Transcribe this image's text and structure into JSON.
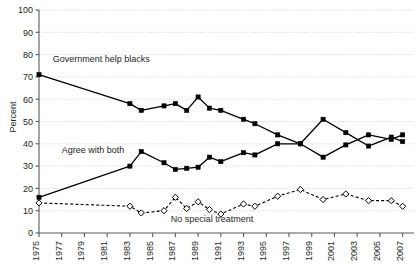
{
  "chart_data": {
    "type": "line",
    "title": "",
    "subtitle": "",
    "xlabel": "",
    "ylabel": "Percent",
    "ylim": [
      0,
      100
    ],
    "xlim": [
      1975,
      2008
    ],
    "ytick_step": 10,
    "yticks": [
      "0",
      "10",
      "20",
      "30",
      "40",
      "50",
      "60",
      "70",
      "80",
      "90",
      "100"
    ],
    "xticks": [
      "1975",
      "1977",
      "1979",
      "1981",
      "1983",
      "1985",
      "1987",
      "1989",
      "1991",
      "1993",
      "1995",
      "1997",
      "1999",
      "2001",
      "2003",
      "2005",
      "2007"
    ],
    "grid": "horizontal-dotted",
    "legend_position": "inline-annotations",
    "annotations": [
      {
        "text": "Government help blacks",
        "x": 1976.2,
        "y": 76.5,
        "anchor": "start"
      },
      {
        "text": "Agree with both",
        "x": 1977.0,
        "y": 36.0,
        "anchor": "start"
      },
      {
        "text": "No special treatment",
        "x": 1986.6,
        "y": 5.0,
        "anchor": "start"
      }
    ],
    "series": [
      {
        "name": "Government help blacks",
        "marker": "filled-square",
        "line": "solid",
        "color": "#000000",
        "points": [
          {
            "x": 1975,
            "y": 71
          },
          {
            "x": 1983,
            "y": 58
          },
          {
            "x": 1984,
            "y": 55
          },
          {
            "x": 1986,
            "y": 57
          },
          {
            "x": 1987,
            "y": 58
          },
          {
            "x": 1988,
            "y": 55
          },
          {
            "x": 1989,
            "y": 61
          },
          {
            "x": 1990,
            "y": 56
          },
          {
            "x": 1991,
            "y": 55
          },
          {
            "x": 1993,
            "y": 51
          },
          {
            "x": 1994,
            "y": 49
          },
          {
            "x": 1996,
            "y": 44
          },
          {
            "x": 1998,
            "y": 40
          },
          {
            "x": 2000,
            "y": 51
          },
          {
            "x": 2002,
            "y": 45
          },
          {
            "x": 2004,
            "y": 39
          },
          {
            "x": 2006,
            "y": 43
          },
          {
            "x": 2007,
            "y": 41
          }
        ]
      },
      {
        "name": "Agree with both",
        "marker": "filled-square",
        "line": "solid",
        "color": "#000000",
        "points": [
          {
            "x": 1975,
            "y": 16
          },
          {
            "x": 1983,
            "y": 30
          },
          {
            "x": 1984,
            "y": 36.5
          },
          {
            "x": 1986,
            "y": 31.5
          },
          {
            "x": 1987,
            "y": 28.5
          },
          {
            "x": 1988,
            "y": 29
          },
          {
            "x": 1989,
            "y": 29.5
          },
          {
            "x": 1990,
            "y": 34
          },
          {
            "x": 1991,
            "y": 32
          },
          {
            "x": 1993,
            "y": 36
          },
          {
            "x": 1994,
            "y": 35
          },
          {
            "x": 1996,
            "y": 40
          },
          {
            "x": 1998,
            "y": 40
          },
          {
            "x": 2000,
            "y": 34
          },
          {
            "x": 2002,
            "y": 39.5
          },
          {
            "x": 2004,
            "y": 44
          },
          {
            "x": 2006,
            "y": 42
          },
          {
            "x": 2007,
            "y": 44
          }
        ]
      },
      {
        "name": "No special treatment",
        "marker": "open-diamond",
        "line": "dashed",
        "color": "#000000",
        "points": [
          {
            "x": 1975,
            "y": 13.5
          },
          {
            "x": 1983,
            "y": 12
          },
          {
            "x": 1984,
            "y": 9
          },
          {
            "x": 1986,
            "y": 10
          },
          {
            "x": 1987,
            "y": 16
          },
          {
            "x": 1988,
            "y": 11
          },
          {
            "x": 1989,
            "y": 14
          },
          {
            "x": 1990,
            "y": 10.5
          },
          {
            "x": 1991,
            "y": 8.5
          },
          {
            "x": 1993,
            "y": 13
          },
          {
            "x": 1994,
            "y": 12
          },
          {
            "x": 1996,
            "y": 16.5
          },
          {
            "x": 1998,
            "y": 19.5
          },
          {
            "x": 2000,
            "y": 15
          },
          {
            "x": 2002,
            "y": 17.5
          },
          {
            "x": 2004,
            "y": 14.5
          },
          {
            "x": 2006,
            "y": 14.5
          },
          {
            "x": 2007,
            "y": 12
          }
        ]
      }
    ]
  }
}
